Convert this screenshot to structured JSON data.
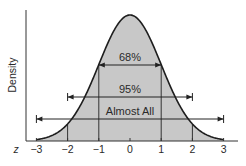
{
  "chart_data": {
    "type": "area",
    "title": "",
    "xlabel": "z",
    "ylabel": "Density",
    "xlim": [
      -3,
      3
    ],
    "x_ticks": [
      -3,
      -2,
      -1,
      0,
      1,
      2,
      3
    ],
    "x_tick_labels": [
      "−3",
      "−2",
      "−1",
      "0",
      "1",
      "2",
      "3"
    ],
    "curve": "standard normal density",
    "series": [
      {
        "name": "Standard normal density",
        "x": [
          -3,
          -2.5,
          -2,
          -1.5,
          -1,
          -0.5,
          0,
          0.5,
          1,
          1.5,
          2,
          2.5,
          3
        ],
        "values": [
          0.004,
          0.018,
          0.054,
          0.13,
          0.242,
          0.352,
          0.399,
          0.352,
          0.242,
          0.13,
          0.054,
          0.018,
          0.004
        ]
      }
    ],
    "annotations": [
      {
        "label": "68%",
        "from": -1,
        "to": 1
      },
      {
        "label": "95%",
        "from": -2,
        "to": 2
      },
      {
        "label": "Almost All",
        "from": -3,
        "to": 3
      }
    ],
    "vertical_lines_at": [
      -2,
      -1,
      1,
      2
    ],
    "grid": false,
    "legend": "none",
    "colors": {
      "fill": "#c8c8c8",
      "line": "#1e1e1e",
      "background": "#ffffff"
    }
  }
}
